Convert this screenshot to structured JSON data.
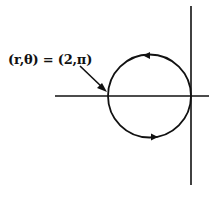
{
  "diagram": {
    "type": "polar-circle",
    "annotation": {
      "label": "(r,θ) = (2,π)"
    },
    "geometry": {
      "circle": {
        "cx": 149.5,
        "cy": 96,
        "r": 41.5
      },
      "x_axis": {
        "x1": 55,
        "x2": 209,
        "y": 96
      },
      "y_axis": {
        "x": 191,
        "y1": 6,
        "y2": 185
      }
    },
    "direction": "counterclockwise",
    "colors": {
      "stroke": "#111111",
      "background": "#ffffff"
    }
  }
}
